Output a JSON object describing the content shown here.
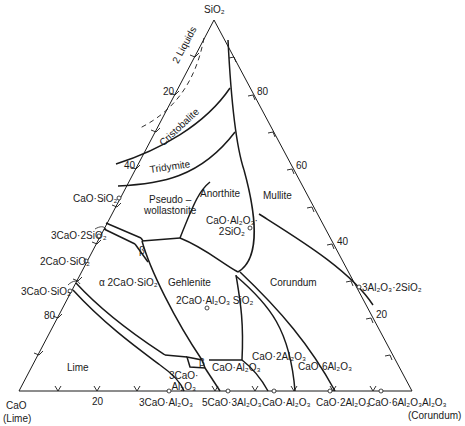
{
  "diagram": {
    "type": "ternary-phase-diagram",
    "vertices": {
      "top": "SiO2",
      "left": "CaO",
      "left_sub": "(Lime)",
      "right": "Al2O3",
      "right_sub": "(Corundum)"
    },
    "vertex_labels": {
      "top": "SiO₂",
      "left": "CaO",
      "left_sub": "(Lime)",
      "right": "Al₂O₃",
      "right_sub": "(Corundum)"
    },
    "left_axis_ticks": [
      "20",
      "40",
      "80"
    ],
    "right_axis_ticks": [
      "80",
      "60",
      "40",
      "20"
    ],
    "bottom_axis_ticks": [
      "20"
    ],
    "fields": [
      {
        "id": "two-liquids",
        "label": "2 Liquids"
      },
      {
        "id": "cristobalite",
        "label": "Cristobalite"
      },
      {
        "id": "tridymite",
        "label": "Tridymite"
      },
      {
        "id": "pseudowollastonite",
        "label": "Pseudo–\nwollastonite",
        "line1": "Pseudo –",
        "line2": "wollastonite"
      },
      {
        "id": "anorthite",
        "label": "Anorthite"
      },
      {
        "id": "mullite",
        "label": "Mullite"
      },
      {
        "id": "gehlenite",
        "label": "Gehlenite"
      },
      {
        "id": "corundum",
        "label": "Corundum"
      },
      {
        "id": "alpha-c2s",
        "label": "α 2CaO·SiO₂"
      },
      {
        "id": "lime",
        "label": "Lime"
      },
      {
        "id": "c3a",
        "line1": "3CaO·",
        "line2": "Al₂O₃"
      },
      {
        "id": "ca",
        "label": "CaO·Al₂O₃"
      },
      {
        "id": "ca2",
        "label": "CaO·2Al₂O₃"
      },
      {
        "id": "ca6",
        "label": "CaO·6Al₂O₃"
      },
      {
        "id": "beta-upper",
        "label": "β"
      },
      {
        "id": "beta-lower",
        "label": "β"
      }
    ],
    "compounds_left_edge": [
      {
        "label": "CaO·SiO₂"
      },
      {
        "label": "3CaO·2SiO₂"
      },
      {
        "label": "2CaO·SiO₂"
      },
      {
        "label": "3CaO·SiO₂"
      }
    ],
    "compounds_bottom_edge": [
      {
        "label": "3CaO·Al₂O₃"
      },
      {
        "label": "5CaO·3Al₂O₃"
      },
      {
        "label": "CaO·Al₂O₃"
      },
      {
        "label": "CaO·2Al₂O₃"
      },
      {
        "label": "CaO·6Al₂O₃"
      }
    ],
    "compounds_right_edge": [
      {
        "label": "3Al₂O₃·2SiO₂"
      }
    ],
    "interior_compounds": [
      {
        "line1": "CaO·Al₂O₃·",
        "line2": "2SiO₂"
      },
      {
        "label": "2CaO·Al₂O₃ SiO₂"
      }
    ]
  }
}
